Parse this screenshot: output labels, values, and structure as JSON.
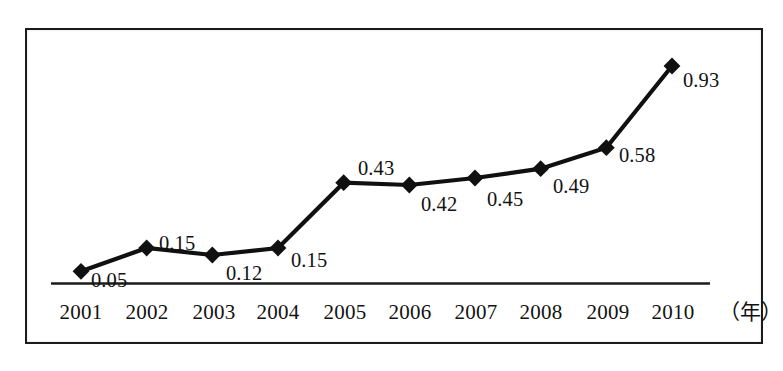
{
  "chart_data": {
    "type": "line",
    "title": "",
    "subtitle": "",
    "xlabel": "年",
    "ylabel": "",
    "grid": false,
    "legend": "none",
    "axis": {
      "x_axis_visible": true,
      "y_axis_visible": false,
      "xlim": [
        "2001",
        "2010"
      ],
      "ylim": [
        0,
        1.0
      ]
    },
    "categories": [
      "2001",
      "2002",
      "2003",
      "2004",
      "2005",
      "2006",
      "2007",
      "2008",
      "2009",
      "2010"
    ],
    "values": [
      0.05,
      0.15,
      0.12,
      0.15,
      0.43,
      0.42,
      0.45,
      0.49,
      0.58,
      0.93
    ],
    "point_labels": [
      "0.05",
      "0.15",
      "0.12",
      "0.15",
      "0.43",
      "0.42",
      "0.45",
      "0.49",
      "0.58",
      "0.93"
    ],
    "marker": "diamond",
    "series": [
      {
        "name": "",
        "values": [
          0.05,
          0.15,
          0.12,
          0.15,
          0.43,
          0.42,
          0.45,
          0.49,
          0.58,
          0.93
        ]
      }
    ],
    "colors": {
      "line": "#101010",
      "marker": "#101010",
      "axis": "#1b1b1b",
      "frame": "#1b1b1b",
      "background": "#ffffff",
      "label_text": "#121212"
    }
  },
  "x_axis": {
    "unit_label": "（年）",
    "ticks": [
      {
        "label": "2001"
      },
      {
        "label": "2002"
      },
      {
        "label": "2003"
      },
      {
        "label": "2004"
      },
      {
        "label": "2005"
      },
      {
        "label": "2006"
      },
      {
        "label": "2007"
      },
      {
        "label": "2008"
      },
      {
        "label": "2009"
      },
      {
        "label": "2010"
      }
    ]
  },
  "caption": {
    "clipped_text": ""
  }
}
